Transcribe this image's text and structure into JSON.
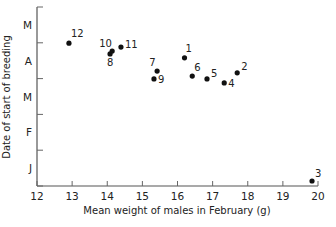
{
  "chart_data": {
    "type": "scatter",
    "title": "",
    "xlabel": "Mean weight of males in February (g)",
    "ylabel": "Date of start of breeding",
    "xlim": [
      12,
      20
    ],
    "x_ticks": [
      12,
      13,
      14,
      15,
      16,
      17,
      18,
      19,
      20
    ],
    "y_axis_note": "y values are months elapsed since 1 January (0 = 1 Jan, 5 = 1 Jun)",
    "ylim": [
      0,
      5
    ],
    "y_tick_positions": [
      0,
      1,
      2,
      3,
      4,
      5
    ],
    "y_tick_labels": [
      {
        "label": "J",
        "center": 0.5
      },
      {
        "label": "F",
        "center": 1.5
      },
      {
        "label": "M",
        "center": 2.5
      },
      {
        "label": "A",
        "center": 3.5
      },
      {
        "label": "M",
        "center": 4.5
      }
    ],
    "grid": false,
    "legend": null,
    "points": [
      {
        "label": "1",
        "x": 16.2,
        "y": 3.58,
        "lx": 1,
        "ly": -6
      },
      {
        "label": "2",
        "x": 17.7,
        "y": 3.16,
        "lx": 4,
        "ly": -3
      },
      {
        "label": "3",
        "x": 19.83,
        "y": 0.14,
        "lx": 3,
        "ly": -4
      },
      {
        "label": "4",
        "x": 17.33,
        "y": 2.88,
        "lx": 4,
        "ly": 4
      },
      {
        "label": "5",
        "x": 16.84,
        "y": 2.99,
        "lx": 4,
        "ly": -2
      },
      {
        "label": "6",
        "x": 16.42,
        "y": 3.07,
        "lx": 2,
        "ly": -5
      },
      {
        "label": "7",
        "x": 15.42,
        "y": 3.21,
        "lx": -8,
        "ly": -5
      },
      {
        "label": "8",
        "x": 14.08,
        "y": 3.69,
        "lx": -3,
        "ly": 12
      },
      {
        "label": "9",
        "x": 15.33,
        "y": 2.99,
        "lx": 4,
        "ly": 4
      },
      {
        "label": "10",
        "x": 14.14,
        "y": 3.77,
        "lx": -13,
        "ly": -4
      },
      {
        "label": "11",
        "x": 14.39,
        "y": 3.88,
        "lx": 4,
        "ly": 1
      },
      {
        "label": "12",
        "x": 12.91,
        "y": 3.99,
        "lx": 2,
        "ly": -6
      }
    ]
  }
}
